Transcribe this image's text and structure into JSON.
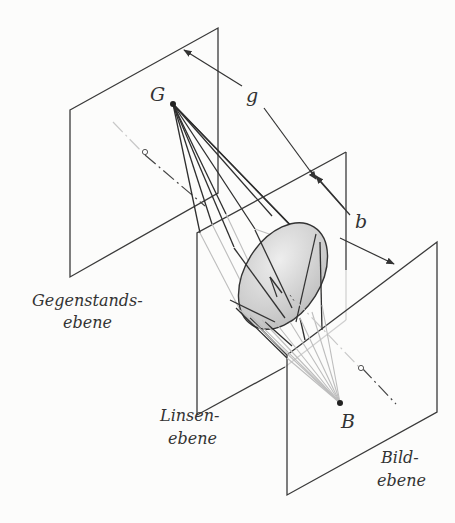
{
  "diagram": {
    "type": "optics-imaging-planes",
    "labels": {
      "object_point": "G",
      "image_point": "B",
      "object_distance": "g",
      "image_distance": "b",
      "object_plane_line1": "Gegenstands-",
      "object_plane_line2": "ebene",
      "lens_plane_line1": "Linsen-",
      "lens_plane_line2": "ebene",
      "image_plane_line1": "Bild-",
      "image_plane_line2": "ebene"
    },
    "planes": [
      {
        "name": "Gegenstandsebene",
        "role": "object plane"
      },
      {
        "name": "Linsenebene",
        "role": "lens plane"
      },
      {
        "name": "Bildebene",
        "role": "image plane"
      }
    ],
    "colors": {
      "line": "#3a3a3a",
      "light_ray": "#bdbdbd",
      "lens_fill": "#d0d0d0",
      "background": "#fcfcfb"
    }
  }
}
